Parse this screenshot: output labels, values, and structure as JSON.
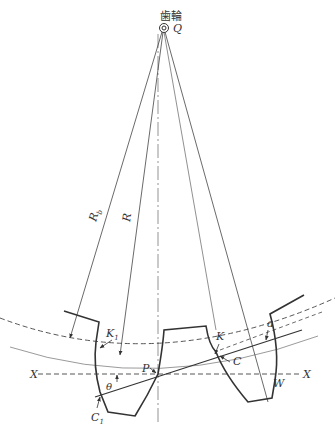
{
  "title": "歯輪",
  "labels": {
    "center": "Q",
    "base_radius": "R",
    "base_radius_sub": "b",
    "pitch_radius": "R",
    "contact_k1": "K",
    "contact_k1_sub": "1",
    "contact_k": "K",
    "pitch_point": "P",
    "contact_c": "C",
    "contact_c1": "C",
    "contact_c1_sub": "1",
    "angle": "θ",
    "alpha": "a",
    "point_w": "W",
    "axis_left": "X",
    "axis_right": "X"
  },
  "colors": {
    "line": "#3a3a3a",
    "thin": "#555555",
    "background": "#ffffff"
  }
}
